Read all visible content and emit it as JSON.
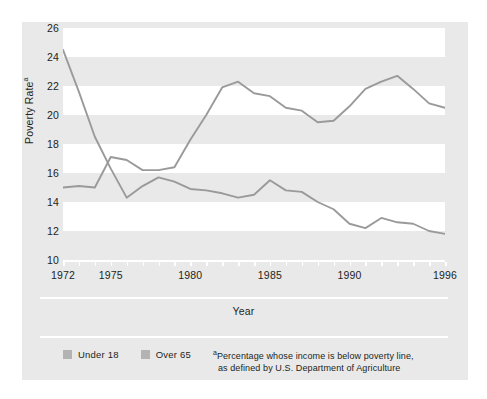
{
  "figure": {
    "background_color": "#e9e9e9",
    "page_color": "#ffffff",
    "band_color": "#ffffff",
    "line_color": "#9a9a9a",
    "text_color": "#231f20"
  },
  "axes": {
    "y_title_text": "Poverty Rate",
    "y_title_superscript": "a",
    "x_title": "Year"
  },
  "legend": {
    "items": [
      {
        "label": "Under 18",
        "color": "#b3b3b3"
      },
      {
        "label": "Over 65",
        "color": "#b3b3b3"
      }
    ]
  },
  "footnote": {
    "marker": "a",
    "line1": "Percentage whose income is below poverty line,",
    "line2": "as defined by U.S. Department of Agriculture"
  },
  "chart_data": {
    "type": "line",
    "title": "",
    "xlabel": "Year",
    "ylabel": "Poverty Rate",
    "ylabel_footnote": "a",
    "xlim": [
      1972,
      1996
    ],
    "ylim": [
      10,
      26
    ],
    "yticks": [
      10,
      12,
      14,
      16,
      18,
      20,
      22,
      24,
      26
    ],
    "xticks_labeled": [
      1972,
      1975,
      1980,
      1985,
      1990,
      1996
    ],
    "xticks_all": [
      1972,
      1973,
      1974,
      1975,
      1976,
      1977,
      1978,
      1979,
      1980,
      1981,
      1982,
      1983,
      1984,
      1985,
      1986,
      1987,
      1988,
      1989,
      1990,
      1991,
      1992,
      1993,
      1994,
      1995,
      1996
    ],
    "grid": "horizontal-bands",
    "legend_position": "bottom-left",
    "x": [
      1972,
      1973,
      1974,
      1975,
      1976,
      1977,
      1978,
      1979,
      1980,
      1981,
      1982,
      1983,
      1984,
      1985,
      1986,
      1987,
      1988,
      1989,
      1990,
      1991,
      1992,
      1993,
      1994,
      1995,
      1996
    ],
    "series": [
      {
        "name": "Under 18",
        "color": "#9a9a9a",
        "values": [
          15.0,
          15.1,
          15.0,
          17.1,
          16.9,
          16.2,
          16.2,
          16.4,
          18.3,
          20.0,
          21.9,
          22.3,
          21.5,
          21.3,
          20.5,
          20.3,
          19.5,
          19.6,
          20.6,
          21.8,
          22.3,
          22.7,
          21.8,
          20.8,
          20.5
        ]
      },
      {
        "name": "Over 65",
        "color": "#9a9a9a",
        "values": [
          24.5,
          21.6,
          18.5,
          16.3,
          14.3,
          15.1,
          15.7,
          15.4,
          14.9,
          14.8,
          14.6,
          14.3,
          14.5,
          15.5,
          14.8,
          14.7,
          14.0,
          13.5,
          12.5,
          12.2,
          12.9,
          12.6,
          12.5,
          12.0,
          11.8
        ]
      }
    ],
    "series_note": "Under 18 rises from ~15 in 1972 to ~22 in 1994; Over 65 falls from ~24.5 in 1972 to ~11.8 in 1996"
  }
}
